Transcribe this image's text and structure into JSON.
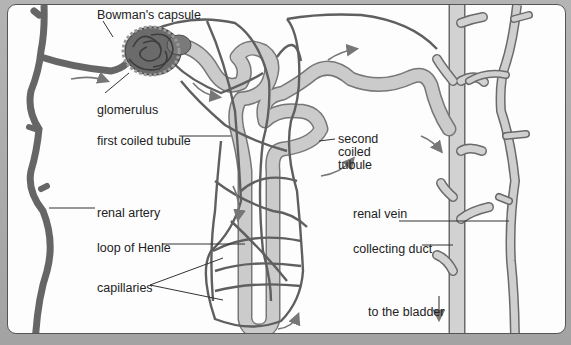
{
  "diagram": {
    "colors": {
      "background_frame": "#a9a9a9",
      "panel": "#fdfdfd",
      "blood_vessel": "#6e6e6e",
      "tubule": "#c9c9c9",
      "vein_duct": "#cdcdcd",
      "outline": "#5a5a5a",
      "text": "#222222"
    },
    "labels": {
      "bowmans_capsule": "Bowman's capsule",
      "glomerulus": "glomerulus",
      "first_coiled_tubule": "first coiled tubule",
      "second_coiled_tubule": "second\ncoiled\ntubule",
      "second_line1": "second",
      "second_line2": "coiled",
      "second_line3": "tubule",
      "renal_artery": "renal artery",
      "loop_of_henle": "loop of Henle",
      "capillaries": "capillaries",
      "renal_vein": "renal vein",
      "collecting_duct": "collecting duct",
      "to_the_bladder": "to the bladder"
    },
    "arrows": [
      {
        "name": "flow-into-glomerulus",
        "direction": "right"
      },
      {
        "name": "flow-out-of-capsule",
        "direction": "right-down"
      },
      {
        "name": "flow-along-tubule",
        "direction": "right"
      },
      {
        "name": "flow-down-loop",
        "direction": "down"
      },
      {
        "name": "flow-up-loop",
        "direction": "up"
      },
      {
        "name": "flow-into-duct",
        "direction": "right-down"
      },
      {
        "name": "flow-second-coiled",
        "direction": "up"
      },
      {
        "name": "to-bladder",
        "direction": "down"
      }
    ]
  }
}
